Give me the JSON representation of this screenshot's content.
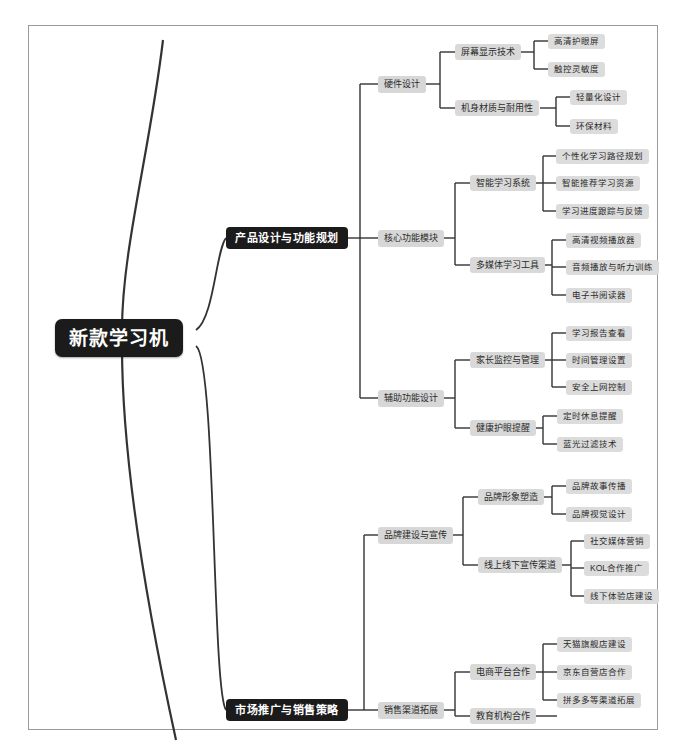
{
  "document": {
    "type": "mindmap",
    "title": "新款学习机",
    "background_color": "#ffffff",
    "frame_color": "#9a9a9a",
    "root_color": "#1b1b1b",
    "branch_color": "#1b1b1b",
    "node_color": "#d9d9d9",
    "edge_color": "#333333"
  },
  "root": {
    "label": "新款学习机"
  },
  "branches": [
    {
      "label": "产品设计与功能规划",
      "children": [
        {
          "label": "硬件设计",
          "children": [
            {
              "label": "屏幕显示技术",
              "children": [
                {
                  "label": "高清护眼屏"
                },
                {
                  "label": "触控灵敏度"
                }
              ]
            },
            {
              "label": "机身材质与耐用性",
              "children": [
                {
                  "label": "轻量化设计"
                },
                {
                  "label": "环保材料"
                }
              ]
            }
          ]
        },
        {
          "label": "核心功能模块",
          "children": [
            {
              "label": "智能学习系统",
              "children": [
                {
                  "label": "个性化学习路径规划"
                },
                {
                  "label": "智能推荐学习资源"
                },
                {
                  "label": "学习进度跟踪与反馈"
                }
              ]
            },
            {
              "label": "多媒体学习工具",
              "children": [
                {
                  "label": "高清视频播放器"
                },
                {
                  "label": "音频播放与听力训练"
                },
                {
                  "label": "电子书阅读器"
                }
              ]
            }
          ]
        },
        {
          "label": "辅助功能设计",
          "children": [
            {
              "label": "家长监控与管理",
              "children": [
                {
                  "label": "学习报告查看"
                },
                {
                  "label": "时间管理设置"
                },
                {
                  "label": "安全上网控制"
                }
              ]
            },
            {
              "label": "健康护眼提醒",
              "children": [
                {
                  "label": "定时休息提醒"
                },
                {
                  "label": "蓝光过滤技术"
                }
              ]
            }
          ]
        }
      ]
    },
    {
      "label": "市场推广与销售策略",
      "children": [
        {
          "label": "品牌建设与宣传",
          "children": [
            {
              "label": "品牌形象塑造",
              "children": [
                {
                  "label": "品牌故事传播"
                },
                {
                  "label": "品牌视觉设计"
                }
              ]
            },
            {
              "label": "线上线下宣传渠道",
              "children": [
                {
                  "label": "社交媒体营销"
                },
                {
                  "label": "KOL合作推广"
                },
                {
                  "label": "线下体验店建设"
                }
              ]
            }
          ]
        },
        {
          "label": "销售渠道拓展",
          "children": [
            {
              "label": "电商平台合作",
              "children": [
                {
                  "label": "天猫旗舰店建设"
                },
                {
                  "label": "京东自营店合作"
                },
                {
                  "label": "拼多多等渠道拓展"
                }
              ]
            },
            {
              "label": "教育机构合作",
              "children": []
            }
          ]
        }
      ]
    }
  ]
}
